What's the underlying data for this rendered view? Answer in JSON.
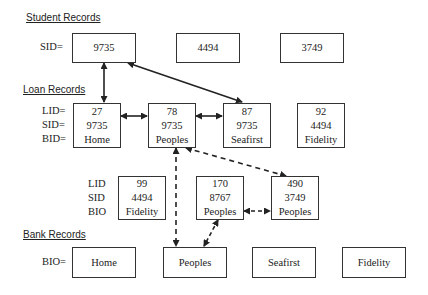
{
  "sections": {
    "student": {
      "title": "Student Records",
      "label": "SID="
    },
    "loan": {
      "title": "Loan Records",
      "labels": [
        "LID=",
        "SID=",
        "BID="
      ]
    },
    "loan_lower": {
      "labels": [
        "LID",
        "SID",
        "BIO"
      ]
    },
    "bank": {
      "title": "Bank Records",
      "label": "BIO="
    }
  },
  "student_records": [
    {
      "sid": "9735"
    },
    {
      "sid": "4494"
    },
    {
      "sid": "3749"
    }
  ],
  "loan_records": [
    {
      "lid": "27",
      "sid": "9735",
      "bid": "Home"
    },
    {
      "lid": "78",
      "sid": "9735",
      "bid": "Peoples"
    },
    {
      "lid": "87",
      "sid": "9735",
      "bid": "Seafirst"
    },
    {
      "lid": "92",
      "sid": "4494",
      "bid": "Fidelity"
    },
    {
      "lid": "99",
      "sid": "4494",
      "bid": "Fidelity"
    },
    {
      "lid": "170",
      "sid": "8767",
      "bid": "Peoples"
    },
    {
      "lid": "490",
      "sid": "3749",
      "bid": "Peoples"
    }
  ],
  "bank_records": [
    {
      "bio": "Home"
    },
    {
      "bio": "Peoples"
    },
    {
      "bio": "Seafirst"
    },
    {
      "bio": "Fidelity"
    }
  ],
  "links": {
    "solid": [
      "student-9735 <-> loan-27",
      "student-9735 <-> loan-87",
      "loan-27 <-> loan-78",
      "loan-78 <-> loan-87"
    ],
    "dashed": [
      "loan-78 <-> bank-Peoples",
      "loan-78 <-> loan-490",
      "loan-170 <-> loan-490",
      "loan-170 <-> bank-Peoples"
    ]
  }
}
